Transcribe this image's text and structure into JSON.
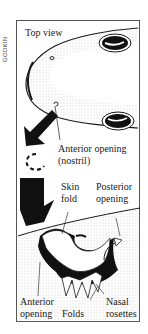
{
  "credit": "GODKIN",
  "labels": {
    "top_view": "Top view",
    "anterior_opening_line1": "Anterior opening",
    "anterior_opening_line2": "(nostril)",
    "skin_fold_line1": "Skin",
    "skin_fold_line2": "fold",
    "posterior_line1": "Posterior",
    "posterior_line2": "opening",
    "anterior_bottom_line1": "Anterior",
    "anterior_bottom_line2": "opening",
    "folds": "Folds",
    "nasal_line1": "Nasal",
    "nasal_line2": "rosettes"
  },
  "colors": {
    "ink": "#1a1a1a",
    "frame": "#555555",
    "stipple": "#bdbdbd",
    "background": "#ffffff"
  }
}
